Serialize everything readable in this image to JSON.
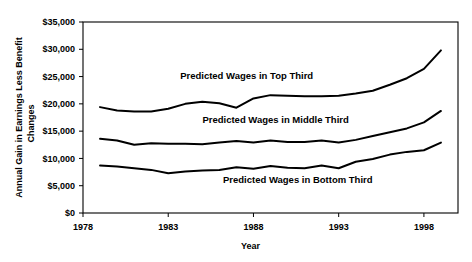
{
  "chart_data": {
    "type": "line",
    "title": "",
    "xlabel": "Year",
    "ylabel": "Annual Gain in Earnings Less Benefit Changes",
    "ylabel_lines": [
      "Annual Gain in Earnings Less Benefit",
      "Changes"
    ],
    "xlim": [
      1978,
      2000
    ],
    "ylim": [
      0,
      35000
    ],
    "grid": false,
    "legend_position": "inline-annotations",
    "xticks": [
      1978,
      1983,
      1988,
      1993,
      1998
    ],
    "xtick_labels": [
      "1978",
      "1983",
      "1988",
      "1993",
      "1998"
    ],
    "yticks": [
      0,
      5000,
      10000,
      15000,
      20000,
      25000,
      30000,
      35000
    ],
    "ytick_labels": [
      "$0",
      "$5,000",
      "$10,000",
      "$15,000",
      "$20,000",
      "$25,000",
      "$30,000",
      "$35,000"
    ],
    "x": [
      1979,
      1980,
      1981,
      1982,
      1983,
      1984,
      1985,
      1986,
      1987,
      1988,
      1989,
      1990,
      1991,
      1992,
      1993,
      1994,
      1995,
      1996,
      1997,
      1998,
      1999
    ],
    "series": [
      {
        "name": "Predicted Wages in Top Third",
        "color": "#000000",
        "values": [
          19400,
          18800,
          18600,
          18600,
          19100,
          20000,
          20400,
          20100,
          19300,
          21000,
          21600,
          21500,
          21400,
          21400,
          21500,
          21900,
          22400,
          23500,
          24700,
          26400,
          29800
        ]
      },
      {
        "name": "Predicted Wages in Middle Third",
        "color": "#000000",
        "values": [
          13600,
          13300,
          12500,
          12800,
          12700,
          12700,
          12600,
          12900,
          13200,
          12900,
          13300,
          13000,
          13000,
          13300,
          12900,
          13400,
          14100,
          14800,
          15500,
          16600,
          18700
        ]
      },
      {
        "name": "Predicted Wages in Bottom Third",
        "color": "#000000",
        "values": [
          8700,
          8500,
          8200,
          7900,
          7300,
          7600,
          7800,
          7900,
          8400,
          8100,
          8600,
          8300,
          8200,
          8700,
          8200,
          9400,
          9900,
          10700,
          11200,
          11500,
          12900
        ]
      }
    ],
    "annotations": [
      {
        "text": "Predicted Wages in Top Third",
        "x": 1987.6,
        "y": 24600
      },
      {
        "text": "Predicted Wages in Middle Third",
        "x": 1989.3,
        "y": 16500
      },
      {
        "text": "Predicted Wages in Bottom Third",
        "x": 1990.6,
        "y": 5500
      }
    ]
  },
  "axes": {
    "frame_color": "#000000",
    "background": "#ffffff"
  }
}
